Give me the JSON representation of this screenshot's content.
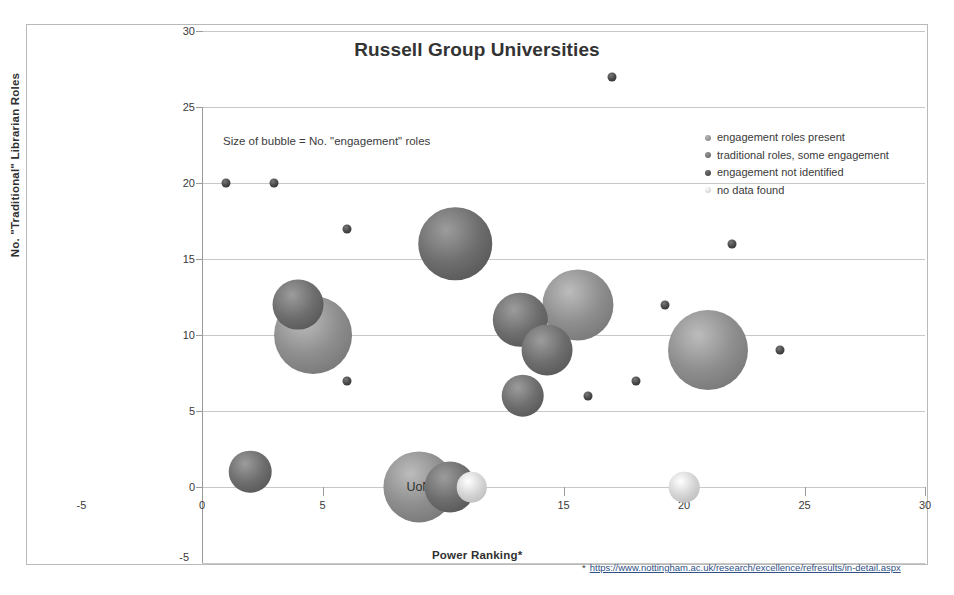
{
  "chart_data": {
    "type": "scatter",
    "title": "Russell Group Universities",
    "xlabel": "Power Ranking*",
    "ylabel": "No. \"Traditional\" Librarian Roles",
    "xlim": [
      -5,
      30
    ],
    "ylim": [
      -5,
      30
    ],
    "xticks": [
      "-5",
      "0",
      "5",
      "10",
      "15",
      "20",
      "25",
      "30"
    ],
    "yticks": [
      "-5",
      "0",
      "5",
      "10",
      "15",
      "20",
      "25",
      "30"
    ],
    "grid": "horizontal",
    "annotation": "Size of bubble = No. \"engagement\" roles",
    "legend_position": "top-right",
    "footnote_marker": "*",
    "footnote_url": "https://www.nottingham.ac.uk/research/excellence/refresults/in-detail.aspx",
    "series": [
      {
        "name": "engagement roles present",
        "color": "#8e8e8e"
      },
      {
        "name": "traditional roles, some engagement",
        "color": "#6e6e6e"
      },
      {
        "name": "engagement not identified",
        "color": "#4a4a4a"
      },
      {
        "name": "no data found",
        "color": "#d5d5d5"
      }
    ],
    "points": [
      {
        "x": 1,
        "y": 20,
        "size": 0,
        "series": "engagement not identified",
        "label": ""
      },
      {
        "x": 3,
        "y": 20,
        "size": 0,
        "series": "engagement not identified",
        "label": ""
      },
      {
        "x": 6,
        "y": 17,
        "size": 0,
        "series": "engagement not identified",
        "label": ""
      },
      {
        "x": 10.5,
        "y": 16,
        "size": 13,
        "series": "traditional roles, some engagement",
        "label": ""
      },
      {
        "x": 4,
        "y": 12,
        "size": 5,
        "series": "traditional roles, some engagement",
        "label": ""
      },
      {
        "x": 4.6,
        "y": 10,
        "size": 15,
        "series": "engagement roles present",
        "label": ""
      },
      {
        "x": 6,
        "y": 7,
        "size": 0,
        "series": "engagement not identified",
        "label": ""
      },
      {
        "x": 2,
        "y": 1,
        "size": 3,
        "series": "traditional roles, some engagement",
        "label": ""
      },
      {
        "x": 9,
        "y": 0,
        "size": 12,
        "series": "engagement roles present",
        "label": "UoN"
      },
      {
        "x": 10.3,
        "y": 0,
        "size": 5,
        "series": "traditional roles, some engagement",
        "label": ""
      },
      {
        "x": 11.2,
        "y": 0,
        "size": 1,
        "series": "no data found",
        "label": ""
      },
      {
        "x": 13.2,
        "y": 11,
        "size": 6,
        "series": "traditional roles, some engagement",
        "label": ""
      },
      {
        "x": 14.3,
        "y": 9,
        "size": 5,
        "series": "traditional roles, some engagement",
        "label": ""
      },
      {
        "x": 15.6,
        "y": 12,
        "size": 12,
        "series": "engagement roles present",
        "label": ""
      },
      {
        "x": 13.3,
        "y": 6,
        "size": 3,
        "series": "traditional roles, some engagement",
        "label": ""
      },
      {
        "x": 16,
        "y": 6,
        "size": 0,
        "series": "engagement not identified",
        "label": ""
      },
      {
        "x": 17,
        "y": 27,
        "size": 0,
        "series": "engagement not identified",
        "label": ""
      },
      {
        "x": 18,
        "y": 7,
        "size": 0,
        "series": "engagement not identified",
        "label": ""
      },
      {
        "x": 19.2,
        "y": 12,
        "size": 0,
        "series": "engagement not identified",
        "label": ""
      },
      {
        "x": 21,
        "y": 9,
        "size": 16,
        "series": "engagement roles present",
        "label": ""
      },
      {
        "x": 22,
        "y": 16,
        "size": 0,
        "series": "engagement not identified",
        "label": ""
      },
      {
        "x": 24,
        "y": 9,
        "size": 0,
        "series": "engagement not identified",
        "label": ""
      },
      {
        "x": 20,
        "y": 0,
        "size": 1,
        "series": "no data found",
        "label": ""
      }
    ]
  }
}
